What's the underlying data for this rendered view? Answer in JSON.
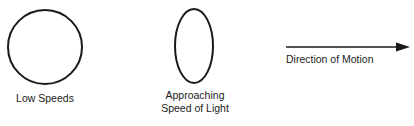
{
  "diagram": {
    "shapes": [
      {
        "type": "circle",
        "label": "Low Speeds",
        "cx": 45,
        "cy": 47,
        "rx": 37,
        "ry": 37
      },
      {
        "type": "ellipse",
        "label_lines": [
          "Approaching",
          "Speed of Light"
        ],
        "cx": 194,
        "cy": 46,
        "rx": 19,
        "ry": 37
      }
    ],
    "arrow": {
      "label": "Direction of Motion",
      "x1": 286,
      "y1": 47,
      "x2": 410,
      "y2": 47
    },
    "stroke_color": "#1a1a1a"
  },
  "labels": {
    "low_speeds": "Low Speeds",
    "approaching_line1": "Approaching",
    "approaching_line2": "Speed of Light",
    "direction": "Direction of Motion"
  }
}
